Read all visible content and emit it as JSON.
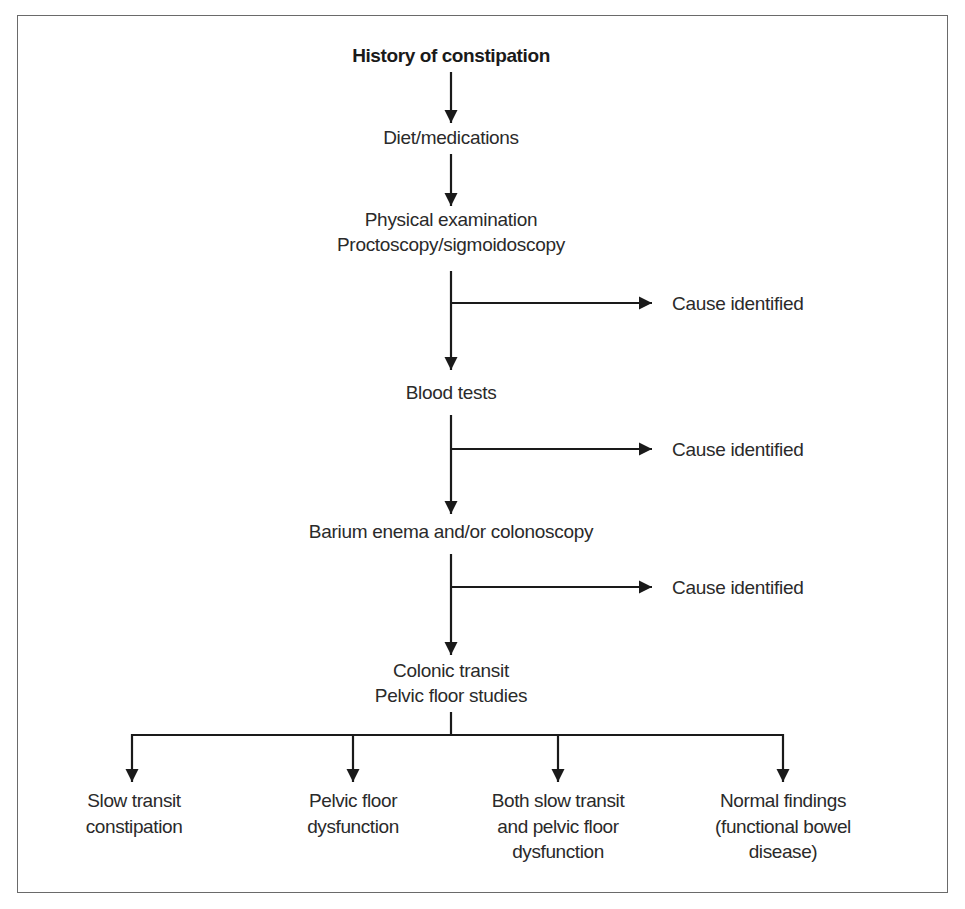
{
  "diagram": {
    "type": "flowchart",
    "title": "History of constipation",
    "main_steps": [
      {
        "id": "history",
        "lines": [
          "History of constipation"
        ]
      },
      {
        "id": "diet",
        "lines": [
          "Diet/medications"
        ]
      },
      {
        "id": "exam",
        "lines": [
          "Physical examination",
          "Proctoscopy/sigmoidoscopy"
        ]
      },
      {
        "id": "blood",
        "lines": [
          "Blood tests"
        ]
      },
      {
        "id": "barium",
        "lines": [
          "Barium enema and/or colonoscopy"
        ]
      },
      {
        "id": "transit",
        "lines": [
          "Colonic transit",
          "Pelvic floor studies"
        ]
      }
    ],
    "side_exits": [
      {
        "from": "exam",
        "label": "Cause identified"
      },
      {
        "from": "blood",
        "label": "Cause identified"
      },
      {
        "from": "barium",
        "label": "Cause identified"
      }
    ],
    "outcomes": [
      {
        "id": "slow",
        "lines": [
          "Slow transit",
          "constipation"
        ]
      },
      {
        "id": "pelvic",
        "lines": [
          "Pelvic floor",
          "dysfunction"
        ]
      },
      {
        "id": "both",
        "lines": [
          "Both slow transit",
          "and pelvic floor",
          "dysfunction"
        ]
      },
      {
        "id": "normal",
        "lines": [
          "Normal findings",
          "(functional bowel",
          "disease)"
        ]
      }
    ],
    "colors": {
      "text": "#2a2a2a",
      "lines": "#1a1a1a",
      "frame": "#6a6a6a",
      "background": "#ffffff"
    }
  }
}
